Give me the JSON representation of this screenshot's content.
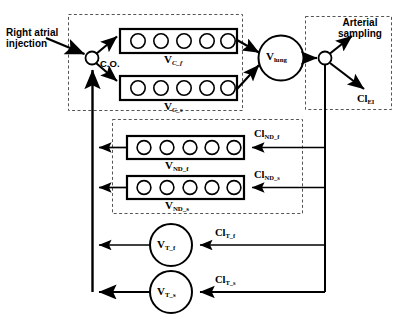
{
  "diagram": {
    "type": "flow-diagram",
    "background_color": "#ffffff",
    "line_color": "#000000",
    "dashed_box_color": "#555555"
  },
  "labels": {
    "right_atrial_injection": "Right atrial injection",
    "right_atrial_injection_line1": "Right atrial",
    "right_atrial_injection_line2": "injection",
    "cardiac_output": "C.O.",
    "arterial_sampling_line1": "Arterial",
    "arterial_sampling_line2": "sampling",
    "arterial_sampling": "Arterial sampling"
  },
  "compartments": [
    {
      "id": "v-c-f",
      "label_base": "V",
      "label_sub": "C_f",
      "shape": "box-with-circles",
      "circle_count": 5,
      "group": "central"
    },
    {
      "id": "v-c-s",
      "label_base": "V",
      "label_sub": "C_s",
      "shape": "box-with-circles",
      "circle_count": 5,
      "group": "central"
    },
    {
      "id": "v-lung",
      "label_base": "V",
      "label_sub": "lung",
      "shape": "circle",
      "group": "lung"
    },
    {
      "id": "v-nd-f",
      "label_base": "V",
      "label_sub": "ND_f",
      "shape": "box-with-circles",
      "circle_count": 5,
      "group": "non-distributing"
    },
    {
      "id": "v-nd-s",
      "label_base": "V",
      "label_sub": "ND_s",
      "shape": "box-with-circles",
      "circle_count": 5,
      "group": "non-distributing"
    },
    {
      "id": "v-t-f",
      "label_base": "V",
      "label_sub": "T_f",
      "shape": "circle",
      "group": "tissue"
    },
    {
      "id": "v-t-s",
      "label_base": "V",
      "label_sub": "T_s",
      "shape": "circle",
      "group": "tissue"
    }
  ],
  "clearances": [
    {
      "id": "cl-ei",
      "label_base": "Cl",
      "label_sub": "EI"
    },
    {
      "id": "cl-nd-f",
      "label_base": "Cl",
      "label_sub": "ND_f"
    },
    {
      "id": "cl-nd-s",
      "label_base": "Cl",
      "label_sub": "ND_s"
    },
    {
      "id": "cl-t-f",
      "label_base": "Cl",
      "label_sub": "T_f"
    },
    {
      "id": "cl-t-s",
      "label_base": "Cl",
      "label_sub": "T_s"
    }
  ],
  "junctions": [
    {
      "id": "venous-junction",
      "shape": "small-circle"
    },
    {
      "id": "arterial-junction",
      "shape": "small-circle"
    }
  ],
  "dashed_groups": [
    {
      "id": "central-group",
      "contains": [
        "v-c-f",
        "v-c-s"
      ]
    },
    {
      "id": "arterial-sampling-group",
      "contains": [
        "arterial-junction",
        "cl-ei"
      ]
    },
    {
      "id": "non-distributing-group",
      "contains": [
        "v-nd-f",
        "v-nd-s"
      ]
    }
  ]
}
